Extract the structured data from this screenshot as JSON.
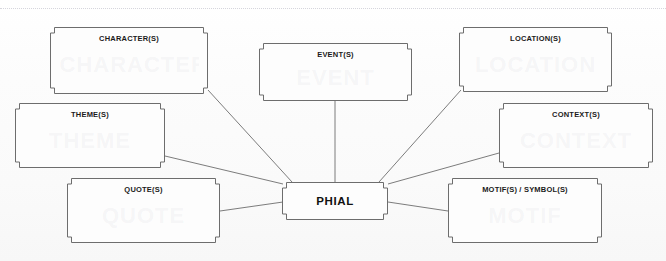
{
  "document": {
    "title": "PHIAL spider diagram",
    "background_color": "#fbfbfb",
    "line_color": "#6d6d6d",
    "text_color": "#1b1b1b",
    "margin_guide": "dotted-page-margin"
  },
  "center": {
    "id": "phial",
    "label": "PHIAL",
    "x": 282,
    "y": 182,
    "w": 106,
    "h": 38
  },
  "nodes": [
    {
      "id": "characters",
      "label": "CHARACTER(S)",
      "ghost": "CHARACTER",
      "x": 50,
      "y": 27,
      "w": 158,
      "h": 67
    },
    {
      "id": "events",
      "label": "EVENT(S)",
      "ghost": "EVENT",
      "x": 259,
      "y": 43,
      "w": 153,
      "h": 58
    },
    {
      "id": "locations",
      "label": "LOCATION(S)",
      "ghost": "LOCATION",
      "x": 459,
      "y": 27,
      "w": 153,
      "h": 65
    },
    {
      "id": "themes",
      "label": "THEME(S)",
      "ghost": "THEME",
      "x": 15,
      "y": 103,
      "w": 150,
      "h": 65
    },
    {
      "id": "contexts",
      "label": "CONTEXT(S)",
      "ghost": "CONTEXT",
      "x": 499,
      "y": 103,
      "w": 154,
      "h": 65
    },
    {
      "id": "quotes",
      "label": "QUOTE(S)",
      "ghost": "QUOTE",
      "x": 67,
      "y": 178,
      "w": 153,
      "h": 65
    },
    {
      "id": "motifs",
      "label": "MOTIF(S) / SYMBOL(S)",
      "ghost": "MOTIF",
      "x": 448,
      "y": 178,
      "w": 154,
      "h": 65
    }
  ],
  "links": [
    {
      "id": "link-characters",
      "from": "characters",
      "to": "phial",
      "x1": 208,
      "y1": 90,
      "x2": 292,
      "y2": 182
    },
    {
      "id": "link-events",
      "from": "events",
      "to": "phial",
      "x1": 335,
      "y1": 101,
      "x2": 335,
      "y2": 182
    },
    {
      "id": "link-locations",
      "from": "locations",
      "to": "phial",
      "x1": 461,
      "y1": 90,
      "x2": 379,
      "y2": 182
    },
    {
      "id": "link-themes",
      "from": "themes",
      "to": "phial",
      "x1": 165,
      "y1": 156,
      "x2": 283,
      "y2": 184
    },
    {
      "id": "link-contexts",
      "from": "contexts",
      "to": "phial",
      "x1": 499,
      "y1": 153,
      "x2": 388,
      "y2": 184
    },
    {
      "id": "link-quotes",
      "from": "quotes",
      "to": "phial",
      "x1": 220,
      "y1": 211,
      "x2": 283,
      "y2": 202
    },
    {
      "id": "link-motifs",
      "from": "motifs",
      "to": "phial",
      "x1": 448,
      "y1": 211,
      "x2": 388,
      "y2": 202
    }
  ]
}
